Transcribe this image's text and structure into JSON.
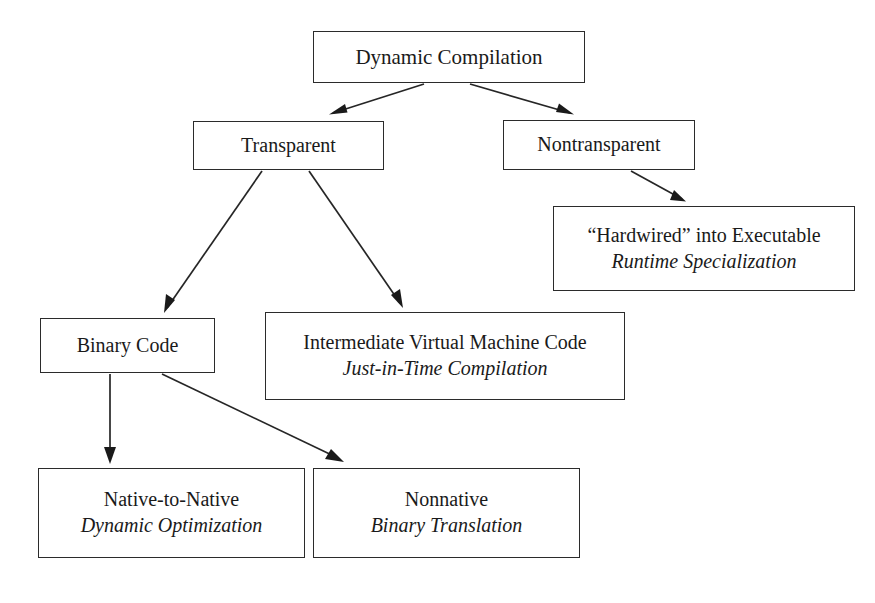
{
  "diagram": {
    "stroke_color": "#262626",
    "box_border_color": "#2b2b2b",
    "background_color": "#ffffff",
    "text_color": "#1a1a1a",
    "nodes": [
      {
        "id": "root",
        "line1": "Dynamic  Compilation",
        "line2": ""
      },
      {
        "id": "transparent",
        "line1": "Transparent",
        "line2": ""
      },
      {
        "id": "nontransparent",
        "line1": "Nontransparent",
        "line2": ""
      },
      {
        "id": "hardwired",
        "line1": "“Hardwired” into Executable",
        "line2": "Runtime Specialization"
      },
      {
        "id": "binary-code",
        "line1": "Binary Code",
        "line2": ""
      },
      {
        "id": "ivmc",
        "line1": "Intermediate Virtual Machine Code",
        "line2": "Just-in-Time Compilation"
      },
      {
        "id": "native",
        "line1": "Native-to-Native",
        "line2": "Dynamic Optimization"
      },
      {
        "id": "nonnative",
        "line1": "Nonnative",
        "line2": "Binary Translation"
      }
    ],
    "edges": [
      {
        "id": "root-to-transparent",
        "from": "root",
        "to": "transparent"
      },
      {
        "id": "root-to-nontransparent",
        "from": "root",
        "to": "nontransparent"
      },
      {
        "id": "nontransparent-to-hardwired",
        "from": "nontransparent",
        "to": "hardwired"
      },
      {
        "id": "transparent-to-binary-code",
        "from": "transparent",
        "to": "binary-code"
      },
      {
        "id": "transparent-to-ivmc",
        "from": "transparent",
        "to": "ivmc"
      },
      {
        "id": "binary-code-to-native",
        "from": "binary-code",
        "to": "native"
      },
      {
        "id": "binary-code-to-nonnative",
        "from": "binary-code",
        "to": "nonnative"
      }
    ]
  }
}
